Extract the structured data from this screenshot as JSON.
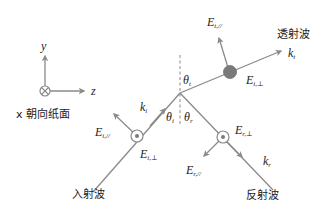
{
  "diagram": {
    "colors": {
      "line": "#8a8a8a",
      "arrow": "#8a8a8a",
      "dot_filled": "#7a7a7a",
      "dashed_normal": "#8a8a8a",
      "text": "#222222",
      "background": "#ffffff"
    },
    "axes": {
      "y_label": "y",
      "z_label": "z",
      "x_note": "x 朝向纸面",
      "x_symbol": "circle-cross"
    },
    "waves": {
      "incident": {
        "label": "入射波",
        "k": "k",
        "k_sub": "i",
        "angle": "θ",
        "angle_sub": "i",
        "E_parallel": "E",
        "E_parallel_sub": "i,//",
        "E_perp": "E",
        "E_perp_sub": "i,⊥",
        "perp_symbol": "circle-dot"
      },
      "reflected": {
        "label": "反射波",
        "k": "k",
        "k_sub": "r",
        "angle": "θ",
        "angle_sub": "r",
        "E_parallel": "E",
        "E_parallel_sub": "r,//",
        "E_perp": "E",
        "E_perp_sub": "r,⊥",
        "perp_symbol": "circle-dot"
      },
      "transmitted": {
        "label": "透射波",
        "k": "k",
        "k_sub": "t",
        "angle": "θ",
        "angle_sub": "t",
        "E_parallel": "E",
        "E_parallel_sub": "t,//",
        "E_perp": "E",
        "E_perp_sub": "i,⊥",
        "perp_symbol": "filled-dot"
      }
    }
  }
}
